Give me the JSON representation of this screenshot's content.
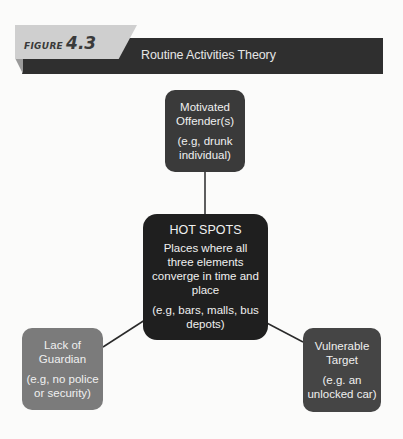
{
  "header": {
    "figure_word": "FIGURE",
    "figure_number": "4.3",
    "title": "Routine Activities Theory"
  },
  "nodes": {
    "offender": {
      "title_line1": "Motivated",
      "title_line2": "Offender(s)",
      "example_line1": "(e.g, drunk",
      "example_line2": "individual)"
    },
    "hotspots": {
      "title": "HOT SPOTS",
      "desc_line1": "Places where all",
      "desc_line2": "three elements",
      "desc_line3": "converge in time and",
      "desc_line4": "place",
      "example_line1": "(e.g, bars, malls, bus",
      "example_line2": "depots)"
    },
    "guardian": {
      "title_line1": "Lack of",
      "title_line2": "Guardian",
      "example_line1": "(e.g, no police",
      "example_line2": "or security)"
    },
    "target": {
      "title_line1": "Vulnerable",
      "title_line2": "Target",
      "example_line1": "(e.g. an",
      "example_line2": "unlocked car)"
    }
  },
  "colors": {
    "header_bar": "#2f2f2f",
    "figure_tab": "#cfcfcf",
    "offender": "#3a3a3a",
    "hotspots": "#1f1f1f",
    "guardian": "#7b7b7b",
    "target": "#454545"
  }
}
